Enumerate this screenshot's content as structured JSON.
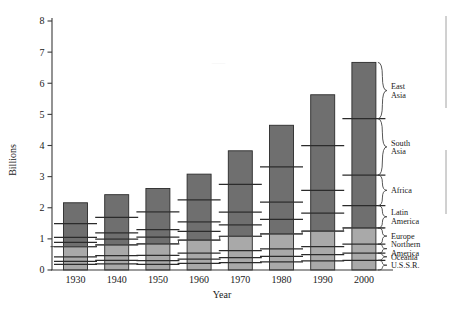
{
  "chart_data": {
    "type": "bar",
    "title": "",
    "subtitle": "",
    "xlabel": "Year",
    "ylabel": "Billions",
    "ylim": [
      0,
      8
    ],
    "xlim_note": "decades 1930-2000",
    "grid": false,
    "legend_position": "right",
    "stacked": true,
    "categories": [
      "1930",
      "1940",
      "1950",
      "1960",
      "1970",
      "1980",
      "1990",
      "2000"
    ],
    "ytick_labels": [
      "0",
      "1",
      "2",
      "3",
      "4",
      "5",
      "6",
      "7",
      "8"
    ],
    "ytick_values": [
      0,
      1,
      2,
      3,
      4,
      5,
      6,
      7,
      8
    ],
    "series": [
      {
        "name": "U.S.S.R.",
        "shade": "light",
        "values": [
          0.18,
          0.2,
          0.18,
          0.21,
          0.24,
          0.26,
          0.29,
          0.31
        ]
      },
      {
        "name": "Oceania",
        "shade": "light",
        "values": [
          0.1,
          0.11,
          0.12,
          0.14,
          0.16,
          0.18,
          0.2,
          0.23
        ]
      },
      {
        "name": "Northern America",
        "shade": "light",
        "values": [
          0.14,
          0.15,
          0.17,
          0.19,
          0.22,
          0.24,
          0.26,
          0.29
        ]
      },
      {
        "name": "Europe",
        "shade": "light",
        "values": [
          0.33,
          0.35,
          0.37,
          0.42,
          0.46,
          0.48,
          0.5,
          0.52
        ]
      },
      {
        "name": "Latin America",
        "shade": "dark",
        "values": [
          0.14,
          0.18,
          0.22,
          0.28,
          0.37,
          0.47,
          0.58,
          0.72
        ]
      },
      {
        "name": "Africa",
        "shade": "dark",
        "values": [
          0.16,
          0.2,
          0.24,
          0.31,
          0.41,
          0.55,
          0.73,
          0.98
        ]
      },
      {
        "name": "South Asia",
        "shade": "dark",
        "values": [
          0.44,
          0.5,
          0.57,
          0.7,
          0.89,
          1.13,
          1.44,
          1.81
        ]
      },
      {
        "name": "East Asia",
        "shade": "dark",
        "values": [
          0.67,
          0.73,
          0.75,
          0.83,
          1.08,
          1.34,
          1.63,
          1.81
        ]
      }
    ],
    "totals": [
      2.16,
      2.42,
      2.62,
      3.08,
      3.83,
      4.65,
      5.83,
      7.67
    ],
    "step_line": {
      "name": "developed-regions cumulative",
      "values": [
        0.75,
        0.81,
        0.84,
        0.96,
        1.08,
        1.16,
        1.25,
        1.35
      ]
    },
    "legend_entries": [
      "East Asia",
      "South Asia",
      "Africa",
      "Latin America",
      "Europe",
      "Northern America",
      "Oceania",
      "U.S.S.R."
    ]
  },
  "axes": {
    "y_title": "Billions",
    "x_title": "Year"
  },
  "colors": {
    "segment_dark": "#6f6f6f",
    "segment_light": "#a9a9a9",
    "outline": "#2b2b2b",
    "axis": "#3a3a3a",
    "step_line": "#4a4a4a",
    "background": "#ffffff"
  }
}
